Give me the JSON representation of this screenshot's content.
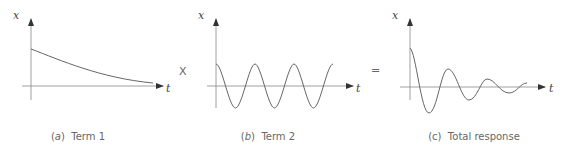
{
  "figure": {
    "panels": [
      {
        "id": "a",
        "letter": "a",
        "title": "Term 1",
        "x_axis": "t",
        "y_axis": "x",
        "curve": "exponential decay"
      },
      {
        "id": "b",
        "letter": "b",
        "title": "Term 2",
        "x_axis": "t",
        "y_axis": "x",
        "curve": "cosine oscillation"
      },
      {
        "id": "c",
        "letter": "c",
        "title": "Total response",
        "x_axis": "t",
        "y_axis": "x",
        "curve": "damped oscillation"
      }
    ],
    "operators": [
      "X",
      "="
    ]
  },
  "colors": {
    "curve": "#666666",
    "axis": "#777777",
    "text": "#555555"
  }
}
